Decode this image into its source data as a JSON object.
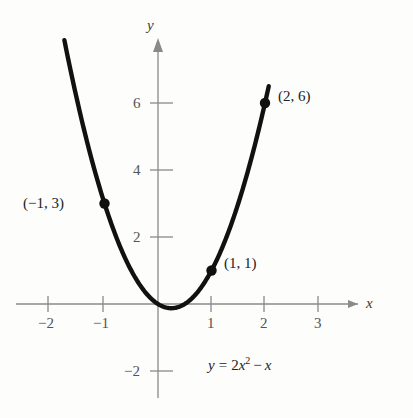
{
  "figure": {
    "kind": "cartesian-graph",
    "equation_label": "y = 2x² − x",
    "equation_parts": {
      "lhs": "y",
      "eq": "=",
      "coef": "2",
      "var": "x",
      "exp": "2",
      "minus": "−",
      "var2": "x"
    },
    "axis_x_name": "x",
    "axis_y_name": "y",
    "colors": {
      "curve": "#111111",
      "axis": "#8a8a8a",
      "point": "#111111",
      "text": "#222222",
      "background": "#fdfdfc"
    }
  },
  "chart_data": {
    "type": "line",
    "title": "",
    "subtitle": "",
    "xlabel": "x",
    "ylabel": "y",
    "equation": "y = 2x^2 - x",
    "xlim": [
      -2.6,
      3.6
    ],
    "ylim": [
      -2.9,
      8.6
    ],
    "xticks": [
      -2,
      -1,
      1,
      2,
      3
    ],
    "xtick_labels": [
      "−2",
      "−1",
      "1",
      "2",
      "3"
    ],
    "yticks": [
      2,
      4,
      6,
      -2
    ],
    "ytick_labels": [
      "2",
      "4",
      "6",
      "−2"
    ],
    "grid": false,
    "legend": null,
    "series": [
      {
        "name": "y = 2x^2 - x",
        "x": [
          -1.75,
          -1.6,
          -1.4,
          -1.2,
          -1.0,
          -0.8,
          -0.6,
          -0.4,
          -0.2,
          0.0,
          0.25,
          0.5,
          0.7,
          0.9,
          1.1,
          1.3,
          1.5,
          1.7,
          1.9,
          2.07
        ],
        "values": [
          7.875,
          6.72,
          5.32,
          4.08,
          3.0,
          2.08,
          1.32,
          0.72,
          0.28,
          0.0,
          -0.125,
          0.0,
          0.28,
          0.72,
          1.32,
          2.08,
          3.0,
          4.08,
          5.32,
          6.49
        ]
      }
    ],
    "annotated_points": [
      {
        "label": "(−1, 3)",
        "x": -1,
        "y": 3,
        "label_side": "left"
      },
      {
        "label": "(1, 1)",
        "x": 1,
        "y": 1,
        "label_side": "right"
      },
      {
        "label": "(2, 6)",
        "x": 2,
        "y": 6,
        "label_side": "right"
      }
    ],
    "vertex": {
      "x": 0.25,
      "y": -0.125
    }
  }
}
